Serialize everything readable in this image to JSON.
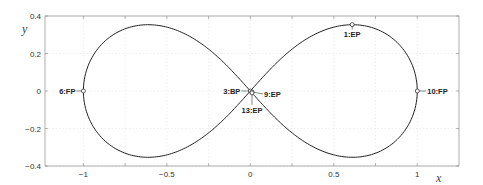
{
  "chart_data": {
    "type": "line",
    "title": "",
    "xlabel": "x",
    "ylabel": "y",
    "xlim": [
      -1.23,
      1.25
    ],
    "ylim": [
      -0.4,
      0.4
    ],
    "grid": true,
    "x_ticks": [
      -1,
      -0.5,
      0,
      0.5,
      1
    ],
    "x_tick_labels": [
      "−1",
      "−0.5",
      "0",
      "0.5",
      "1"
    ],
    "y_ticks": [
      -0.4,
      -0.2,
      0,
      0.2,
      0.4
    ],
    "y_tick_labels": [
      "−0.4",
      "−0.2",
      "0",
      "0.2",
      "0.4"
    ],
    "series": [
      {
        "name": "figure-eight curve (lemniscate)",
        "description": "closed figure-eight, lobes peaking near (±0.61, ±0.354)"
      }
    ],
    "points": [
      {
        "label": "1:EP",
        "x": 0.61,
        "y": 0.354
      },
      {
        "label": "3:BP",
        "x": 0.0,
        "y": 0.0
      },
      {
        "label": "6:FP",
        "x": -1.0,
        "y": 0.0
      },
      {
        "label": "9:EP",
        "x": 0.01,
        "y": -0.005
      },
      {
        "label": "10:FP",
        "x": 1.0,
        "y": 0.0
      },
      {
        "label": "13:EP",
        "x": 0.01,
        "y": -0.01
      }
    ]
  }
}
